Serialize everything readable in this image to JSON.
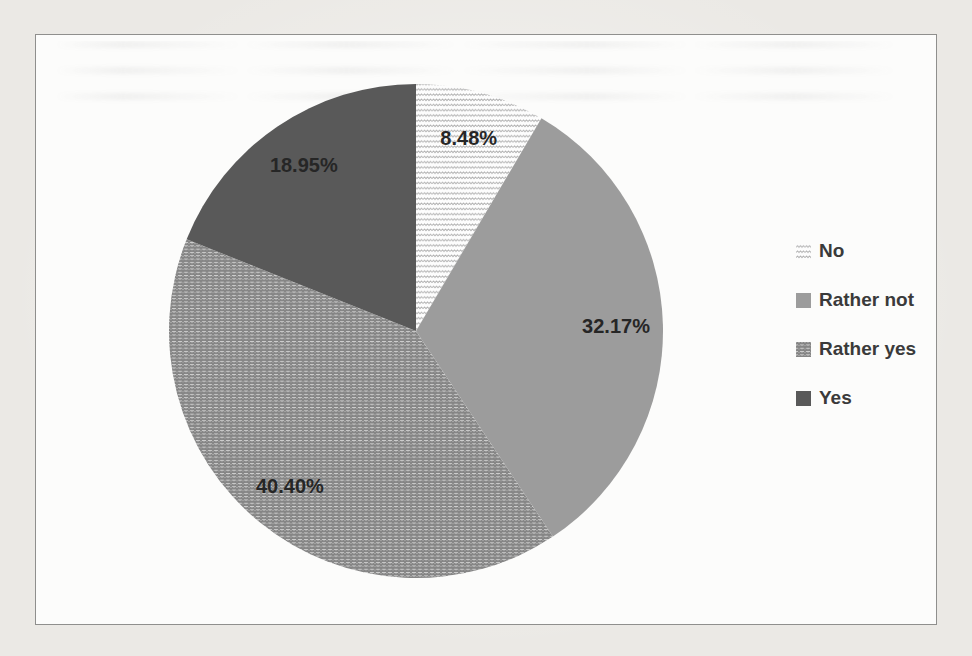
{
  "chart_data": {
    "type": "pie",
    "categories": [
      "No",
      "Rather not",
      "Rather yes",
      "Yes"
    ],
    "values": [
      8.48,
      32.17,
      40.4,
      18.95
    ],
    "labels": [
      "8.48%",
      "32.17%",
      "40.40%",
      "18.95%"
    ],
    "title": "",
    "start_angle_deg": 0,
    "direction": "clockwise",
    "legend_position": "right",
    "label_radius_fraction": 0.81,
    "label_color": "#262626",
    "slice_styles": [
      {
        "fill": "pattern",
        "pattern": "wave",
        "pattern_color": "#aeaeae",
        "background": "#fdfdfd"
      },
      {
        "fill": "solid",
        "color": "#9c9c9c"
      },
      {
        "fill": "pattern",
        "pattern": "zigzag",
        "pattern_color": "#858585",
        "background": "#f7f7f6"
      },
      {
        "fill": "solid",
        "color": "#595959"
      }
    ]
  }
}
